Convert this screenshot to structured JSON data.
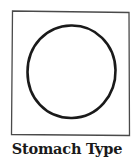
{
  "figure": {
    "caption": "Stomach Type",
    "shape": "circle",
    "colors": {
      "background": "#ffffff",
      "frame_stroke": "#4a4a4a",
      "shape_stroke": "#1a1a1a",
      "caption_text": "#1a1a1a"
    }
  }
}
